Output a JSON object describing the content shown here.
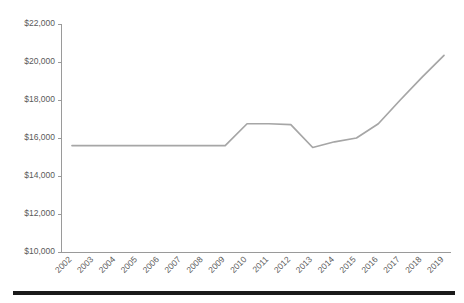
{
  "chart_data": {
    "type": "line",
    "title": "",
    "subtitle": "",
    "xlabel": "",
    "ylabel": "",
    "grid": false,
    "legend": false,
    "legend_position": "none",
    "line_color": "#a6a6a6",
    "axis_color": "#9a9a9a",
    "label_color": "#5a5a5a",
    "categories": [
      "2002",
      "2003",
      "2004",
      "2005",
      "2006",
      "2007",
      "2008",
      "2009",
      "2010",
      "2011",
      "2012",
      "2013",
      "2014",
      "2015",
      "2016",
      "2017",
      "2018",
      "2019"
    ],
    "values": [
      15600,
      15600,
      15600,
      15600,
      15600,
      15600,
      15600,
      15600,
      16750,
      16750,
      16700,
      15500,
      15800,
      16000,
      16750,
      18000,
      19200,
      20350
    ],
    "ylim": [
      10000,
      22000
    ],
    "yticks": [
      10000,
      12000,
      14000,
      16000,
      18000,
      20000,
      22000
    ],
    "ytick_labels": [
      "$10,000",
      "$12,000",
      "$14,000",
      "$16,000",
      "$18,000",
      "$20,000",
      "$22,000"
    ],
    "xtick_labels": [
      "2002",
      "2003",
      "2004",
      "2005",
      "2006",
      "2007",
      "2008",
      "2009",
      "2010",
      "2011",
      "2012",
      "2013",
      "2014",
      "2015",
      "2016",
      "2017",
      "2018",
      "2019"
    ],
    "xtick_rotation": -45
  },
  "footer": {
    "rule_color": "#1a1a1a"
  }
}
